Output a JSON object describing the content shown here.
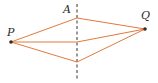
{
  "diagram": {
    "labels": {
      "p": "P",
      "a": "A",
      "q": "Q"
    },
    "colors": {
      "path_line": "#e07a3c",
      "dashed_line": "#333333",
      "point": "#3a2a22",
      "label": "#2a2a2a"
    },
    "points": {
      "P": [
        11,
        42
      ],
      "Q": [
        145,
        29
      ],
      "top": [
        77,
        18
      ],
      "middle": [
        77,
        42
      ],
      "bottom": [
        77,
        62
      ]
    },
    "dashed_line": {
      "x": 77,
      "y1": 4,
      "y2": 80
    }
  }
}
